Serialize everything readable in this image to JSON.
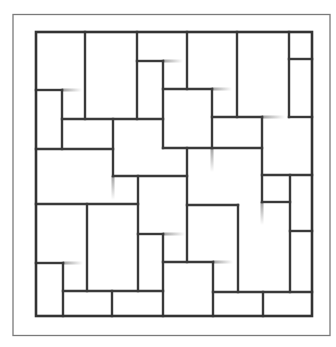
{
  "diagram": {
    "title": "",
    "colors": {
      "background": "#ffffff",
      "line": "#3a3a3a",
      "frame": "#7a7a7a",
      "fade": "#9a9a9a"
    },
    "outer_frame": {
      "left": 13,
      "top": 14.5,
      "right": 330,
      "bottom": 335.5
    },
    "inner_square": {
      "left": 36,
      "top": 32,
      "right": 312,
      "bottom": 316
    },
    "vertical_lines": [
      {
        "x": 85,
        "y1": 32,
        "y2": 119
      },
      {
        "x": 137,
        "y1": 32,
        "y2": 119
      },
      {
        "x": 163,
        "y1": 61,
        "y2": 148
      },
      {
        "x": 187,
        "y1": 32,
        "y2": 89
      },
      {
        "x": 237,
        "y1": 32,
        "y2": 117
      },
      {
        "x": 289,
        "y1": 32,
        "y2": 117
      },
      {
        "x": 62,
        "y1": 90,
        "y2": 149
      },
      {
        "x": 113,
        "y1": 119,
        "y2": 176
      },
      {
        "x": 212,
        "y1": 89,
        "y2": 148
      },
      {
        "x": 262,
        "y1": 117,
        "y2": 202
      },
      {
        "x": 138,
        "y1": 176,
        "y2": 291
      },
      {
        "x": 187,
        "y1": 148,
        "y2": 262
      },
      {
        "x": 87,
        "y1": 204,
        "y2": 291
      },
      {
        "x": 163,
        "y1": 234,
        "y2": 316
      },
      {
        "x": 63,
        "y1": 263,
        "y2": 316
      },
      {
        "x": 112,
        "y1": 291,
        "y2": 316
      },
      {
        "x": 238,
        "y1": 205,
        "y2": 292
      },
      {
        "x": 290,
        "y1": 175,
        "y2": 292
      },
      {
        "x": 213,
        "y1": 262,
        "y2": 316
      },
      {
        "x": 263,
        "y1": 292,
        "y2": 316
      }
    ],
    "horizontal_lines": [
      {
        "y": 61,
        "x1": 137,
        "x2": 163
      },
      {
        "y": 59,
        "x1": 289,
        "x2": 312
      },
      {
        "y": 90,
        "x1": 36,
        "x2": 62
      },
      {
        "y": 89,
        "x1": 163,
        "x2": 212
      },
      {
        "y": 119,
        "x1": 62,
        "x2": 163
      },
      {
        "y": 117,
        "x1": 212,
        "x2": 262
      },
      {
        "y": 117,
        "x1": 289,
        "x2": 312
      },
      {
        "y": 149,
        "x1": 36,
        "x2": 113
      },
      {
        "y": 148,
        "x1": 163,
        "x2": 262
      },
      {
        "y": 176,
        "x1": 113,
        "x2": 187
      },
      {
        "y": 175,
        "x1": 262,
        "x2": 312
      },
      {
        "y": 204,
        "x1": 36,
        "x2": 138
      },
      {
        "y": 205,
        "x1": 187,
        "x2": 238
      },
      {
        "y": 202,
        "x1": 262,
        "x2": 290
      },
      {
        "y": 234,
        "x1": 138,
        "x2": 163
      },
      {
        "y": 231,
        "x1": 290,
        "x2": 312
      },
      {
        "y": 262,
        "x1": 163,
        "x2": 213
      },
      {
        "y": 263,
        "x1": 36,
        "x2": 63
      },
      {
        "y": 291,
        "x1": 63,
        "x2": 163
      },
      {
        "y": 292,
        "x1": 213,
        "x2": 312
      }
    ],
    "fade_tails": [
      {
        "x1": 62,
        "y1": 90,
        "x2": 82,
        "y2": 90,
        "dir": "h"
      },
      {
        "x1": 163,
        "y1": 61,
        "x2": 183,
        "y2": 61,
        "dir": "h"
      },
      {
        "x1": 212,
        "y1": 89,
        "x2": 232,
        "y2": 89,
        "dir": "h"
      },
      {
        "x1": 262,
        "y1": 117,
        "x2": 285,
        "y2": 117,
        "dir": "h"
      },
      {
        "x1": 113,
        "y1": 176,
        "x2": 113,
        "y2": 200,
        "dir": "v"
      },
      {
        "x1": 212,
        "y1": 148,
        "x2": 212,
        "y2": 172,
        "dir": "v"
      },
      {
        "x1": 262,
        "y1": 202,
        "x2": 262,
        "y2": 225,
        "dir": "v"
      },
      {
        "x1": 163,
        "y1": 234,
        "x2": 185,
        "y2": 234,
        "dir": "h"
      },
      {
        "x1": 87,
        "y1": 263,
        "x2": 87,
        "y2": 263,
        "dir": "h"
      },
      {
        "x1": 63,
        "y1": 263,
        "x2": 83,
        "y2": 263,
        "dir": "h"
      },
      {
        "x1": 213,
        "y1": 262,
        "x2": 233,
        "y2": 262,
        "dir": "h"
      },
      {
        "x1": 137,
        "y1": 176,
        "x2": 137,
        "y2": 176,
        "dir": "v"
      }
    ]
  }
}
